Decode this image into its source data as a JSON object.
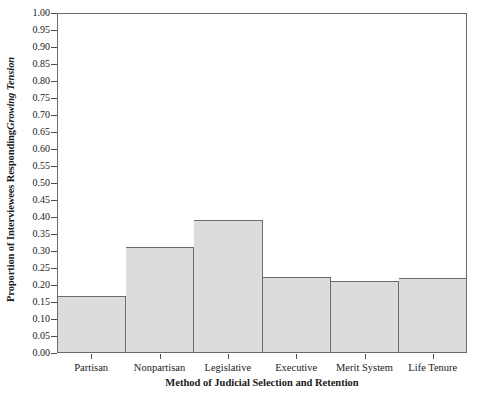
{
  "chart_data": {
    "type": "bar",
    "title": "",
    "categories": [
      "Partisan",
      "Nonpartisan",
      "Legislative",
      "Executive",
      "Merit System",
      "Life Tenure"
    ],
    "values": [
      0.165,
      0.312,
      0.391,
      0.221,
      0.209,
      0.218
    ],
    "xlabel": "Method of Judicial Selection and Retention",
    "ylabel_prefix": "Proportion of Interviewees Responding ",
    "ylabel_italic": "Growing Tension",
    "ylim": [
      0.0,
      1.0
    ],
    "ytick_step": 0.05,
    "ytick_labels": [
      "1.00",
      "0.95",
      "0.90",
      "0.85",
      "0.80",
      "0.75",
      "0.70",
      "0.65",
      "0.60",
      "0.55",
      "0.50",
      "0.45",
      "0.40",
      "0.35",
      "0.30",
      "0.25",
      "0.20",
      "0.15",
      "0.10",
      "0.05",
      "0.00"
    ],
    "ytick_values": [
      1.0,
      0.95,
      0.9,
      0.85,
      0.8,
      0.75,
      0.7,
      0.65,
      0.6,
      0.55,
      0.5,
      0.45,
      0.4,
      0.35,
      0.3,
      0.25,
      0.2,
      0.15,
      0.1,
      0.05,
      0.0
    ],
    "grid": false,
    "legend": false,
    "bar_fill_color": "#dcdcdc",
    "bar_edge_color": "#6b6b6b",
    "axis_color": "#6b6b6b",
    "background_color": "#ffffff"
  }
}
